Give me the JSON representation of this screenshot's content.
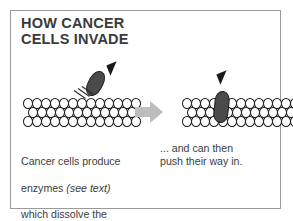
{
  "figure": {
    "title": "HOW CANCER\nCELLS INVADE",
    "border_color": "#9a9a9a",
    "background_color": "#ffffff"
  },
  "diagram": {
    "cell_sheet_rows": 3,
    "cells_per_row": 13,
    "cell_outline_color": "#1a1a1a",
    "cell_fill_color": "#ffffff",
    "cancer_cell_color": "#4a4a4a",
    "arrowhead_color": "#1a1a1a",
    "transition_arrow_color": "#bdbdbd",
    "enzyme_line_count": 3,
    "enzyme_line_color": "#2a2a2a",
    "left_panel_name": "cancer cell above cell sheet releasing enzymes",
    "right_panel_name": "cancer cell wedged into cell sheet"
  },
  "captions": {
    "left_line1": "Cancer cells produce",
    "left_line2_prefix": "enzymes ",
    "left_line2_italic": "(see text)",
    "left_line3": "which dissolve the",
    "left_line4": "\"glue\" between cells...",
    "right": "... and can then\npush their way in."
  }
}
